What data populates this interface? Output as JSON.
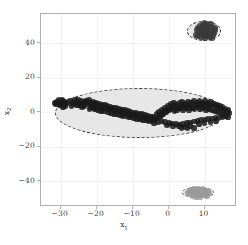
{
  "figure": {
    "background_color": "#ffffff",
    "frame_color": "#b0b0b0",
    "grid_color": "#f2f2f2"
  },
  "axis": {
    "xlabel_main": "x",
    "xlabel_sub": "1",
    "ylabel_main": "x",
    "ylabel_sub": "2",
    "x_ticklabels": [
      "−30",
      "−20",
      "−10",
      "0",
      "10"
    ],
    "y_ticklabels": [
      "40",
      "20",
      "0",
      "−20",
      "−40"
    ]
  },
  "chart_data": {
    "type": "scatter",
    "title": "",
    "xlabel": "x1",
    "ylabel": "x2",
    "xlim": [
      -35.5,
      19.0
    ],
    "ylim": [
      -55.0,
      57.0
    ],
    "xticks": [
      -30,
      -20,
      -10,
      0,
      10
    ],
    "yticks": [
      -40,
      -20,
      0,
      20,
      40
    ],
    "grid": true,
    "legend": "none",
    "annotations": [
      {
        "type": "ellipse",
        "name": "cluster-1-ellipse",
        "center": [
          -8.0,
          -0.5
        ],
        "width": 47.0,
        "height": 29.0,
        "angle": 0,
        "linestyle": "dashed",
        "edgecolor": "#2b2b2b",
        "facecolor": "#e6e6e6",
        "alpha": 0.55
      },
      {
        "type": "ellipse",
        "name": "cluster-2-ellipse",
        "center": [
          9.8,
          47.0
        ],
        "width": 9.5,
        "height": 11.5,
        "angle": 0,
        "linestyle": "dashed",
        "edgecolor": "#2b2b2b",
        "facecolor": "#e6e6e6",
        "alpha": 0.55
      },
      {
        "type": "ellipse",
        "name": "cluster-3-ellipse",
        "center": [
          8.2,
          -46.5
        ],
        "width": 9.0,
        "height": 6.0,
        "angle": 0,
        "linestyle": "dashed",
        "edgecolor": "#6e6e6e",
        "facecolor": "#e6e6e6",
        "alpha": 0.55
      }
    ],
    "series": [
      {
        "name": "cluster-1",
        "marker": "o",
        "color": "#1a1a1a",
        "size": 18,
        "alpha": 0.85,
        "points": [
          [
            -31.6,
            5.4
          ],
          [
            -31.0,
            6.2
          ],
          [
            -30.4,
            5.0
          ],
          [
            -30.6,
            6.9
          ],
          [
            -30.0,
            5.7
          ],
          [
            -29.5,
            6.4
          ],
          [
            -29.9,
            4.4
          ],
          [
            -29.2,
            5.2
          ],
          [
            -28.8,
            6.0
          ],
          [
            -29.6,
            7.1
          ],
          [
            -28.4,
            4.8
          ],
          [
            -30.2,
            3.9
          ],
          [
            -31.3,
            4.6
          ],
          [
            -28.9,
            3.6
          ],
          [
            -29.4,
            2.9
          ],
          [
            -25.8,
            6.1
          ],
          [
            -25.2,
            7.0
          ],
          [
            -24.7,
            5.6
          ],
          [
            -24.2,
            6.8
          ],
          [
            -23.8,
            5.1
          ],
          [
            -24.9,
            4.3
          ],
          [
            -23.4,
            6.3
          ],
          [
            -23.0,
            4.9
          ],
          [
            -25.5,
            4.0
          ],
          [
            -22.6,
            5.8
          ],
          [
            -22.2,
            7.2
          ],
          [
            -21.8,
            5.2
          ],
          [
            -22.9,
            6.6
          ],
          [
            -21.4,
            4.4
          ],
          [
            -23.6,
            3.4
          ],
          [
            -21.0,
            6.0
          ],
          [
            -20.6,
            4.7
          ],
          [
            -21.6,
            3.1
          ],
          [
            -20.2,
            5.5
          ],
          [
            -19.8,
            3.8
          ],
          [
            -20.9,
            2.4
          ],
          [
            -19.4,
            5.0
          ],
          [
            -19.0,
            3.2
          ],
          [
            -20.4,
            1.8
          ],
          [
            -18.6,
            4.4
          ],
          [
            -18.2,
            2.6
          ],
          [
            -19.6,
            1.4
          ],
          [
            -17.8,
            4.0
          ],
          [
            -17.4,
            2.2
          ],
          [
            -18.9,
            0.9
          ],
          [
            -17.0,
            3.6
          ],
          [
            -16.6,
            1.8
          ],
          [
            -18.0,
            0.4
          ],
          [
            -16.2,
            3.1
          ],
          [
            -15.8,
            1.3
          ],
          [
            -16.9,
            0.0
          ],
          [
            -15.4,
            2.7
          ],
          [
            -15.0,
            0.9
          ],
          [
            -16.0,
            -0.5
          ],
          [
            -14.6,
            2.3
          ],
          [
            -14.2,
            0.5
          ],
          [
            -15.2,
            -0.9
          ],
          [
            -13.8,
            1.9
          ],
          [
            -13.4,
            0.1
          ],
          [
            -14.4,
            -1.3
          ],
          [
            -13.0,
            1.5
          ],
          [
            -12.6,
            -0.3
          ],
          [
            -13.6,
            -1.7
          ],
          [
            -12.2,
            1.1
          ],
          [
            -11.8,
            -0.7
          ],
          [
            -12.8,
            -2.1
          ],
          [
            -11.4,
            0.7
          ],
          [
            -11.0,
            -1.1
          ],
          [
            -12.0,
            -2.4
          ],
          [
            -10.6,
            0.3
          ],
          [
            -10.2,
            -1.5
          ],
          [
            -11.2,
            -2.8
          ],
          [
            -9.8,
            -0.1
          ],
          [
            -9.4,
            -1.9
          ],
          [
            -10.4,
            -3.1
          ],
          [
            -9.0,
            -0.5
          ],
          [
            -8.6,
            -2.3
          ],
          [
            -9.6,
            -3.5
          ],
          [
            -8.2,
            -0.9
          ],
          [
            -7.8,
            -2.6
          ],
          [
            -8.8,
            -3.8
          ],
          [
            -7.4,
            -1.2
          ],
          [
            -7.0,
            -3.0
          ],
          [
            -8.0,
            -4.1
          ],
          [
            -6.6,
            -1.6
          ],
          [
            -6.2,
            -3.3
          ],
          [
            -7.2,
            -4.4
          ],
          [
            -5.8,
            -2.0
          ],
          [
            -5.4,
            -3.7
          ],
          [
            -6.4,
            -4.8
          ],
          [
            -5.0,
            -2.4
          ],
          [
            -4.6,
            -4.0
          ],
          [
            -5.6,
            -5.1
          ],
          [
            -4.2,
            -2.7
          ],
          [
            -3.8,
            -4.3
          ],
          [
            -4.8,
            -5.4
          ],
          [
            -3.4,
            -1.2
          ],
          [
            -3.0,
            -3.0
          ],
          [
            -4.0,
            -4.6
          ],
          [
            -2.6,
            0.2
          ],
          [
            -2.2,
            -1.6
          ],
          [
            -3.2,
            -3.4
          ],
          [
            -1.8,
            1.4
          ],
          [
            -1.4,
            -0.4
          ],
          [
            -2.4,
            -2.2
          ],
          [
            -1.0,
            2.6
          ],
          [
            -0.6,
            0.8
          ],
          [
            -1.6,
            -1.0
          ],
          [
            -0.2,
            3.8
          ],
          [
            0.2,
            1.9
          ],
          [
            -0.8,
            0.1
          ],
          [
            0.6,
            4.8
          ],
          [
            1.0,
            2.9
          ],
          [
            0.0,
            1.1
          ],
          [
            1.4,
            5.6
          ],
          [
            1.8,
            3.6
          ],
          [
            0.8,
            1.8
          ],
          [
            2.2,
            4.4
          ],
          [
            2.6,
            2.5
          ],
          [
            1.6,
            0.7
          ],
          [
            3.0,
            5.2
          ],
          [
            3.4,
            3.3
          ],
          [
            2.4,
            1.4
          ],
          [
            3.8,
            6.0
          ],
          [
            4.2,
            4.0
          ],
          [
            3.2,
            2.1
          ],
          [
            4.6,
            5.0
          ],
          [
            5.0,
            3.0
          ],
          [
            4.0,
            1.1
          ],
          [
            5.4,
            6.3
          ],
          [
            5.8,
            4.2
          ],
          [
            4.8,
            2.3
          ],
          [
            6.2,
            5.3
          ],
          [
            6.6,
            3.2
          ],
          [
            5.6,
            1.3
          ],
          [
            7.0,
            6.5
          ],
          [
            7.4,
            4.5
          ],
          [
            6.4,
            2.5
          ],
          [
            7.8,
            5.5
          ],
          [
            8.2,
            3.5
          ],
          [
            7.2,
            1.5
          ],
          [
            8.6,
            6.7
          ],
          [
            9.0,
            4.7
          ],
          [
            8.0,
            2.7
          ],
          [
            9.4,
            5.7
          ],
          [
            9.8,
            3.7
          ],
          [
            8.8,
            1.7
          ],
          [
            10.2,
            6.4
          ],
          [
            10.6,
            4.4
          ],
          [
            9.6,
            2.4
          ],
          [
            11.0,
            5.4
          ],
          [
            11.4,
            3.4
          ],
          [
            10.4,
            1.4
          ],
          [
            11.8,
            5.9
          ],
          [
            12.2,
            3.9
          ],
          [
            11.2,
            1.9
          ],
          [
            12.6,
            5.0
          ],
          [
            13.0,
            3.0
          ],
          [
            12.0,
            1.0
          ],
          [
            13.4,
            4.5
          ],
          [
            13.8,
            2.5
          ],
          [
            12.8,
            0.5
          ],
          [
            14.2,
            3.8
          ],
          [
            14.6,
            1.8
          ],
          [
            13.6,
            -0.2
          ],
          [
            15.0,
            3.0
          ],
          [
            15.4,
            1.0
          ],
          [
            14.4,
            -0.8
          ],
          [
            15.8,
            2.2
          ],
          [
            16.2,
            0.3
          ],
          [
            15.2,
            -1.4
          ],
          [
            16.6,
            1.4
          ],
          [
            16.0,
            -2.0
          ],
          [
            16.9,
            -0.5
          ],
          [
            16.4,
            -2.6
          ],
          [
            -2.0,
            -5.0
          ],
          [
            -1.0,
            -5.6
          ],
          [
            0.0,
            -6.2
          ],
          [
            1.0,
            -6.6
          ],
          [
            2.0,
            -6.9
          ],
          [
            3.0,
            -7.1
          ],
          [
            4.0,
            -6.8
          ],
          [
            5.0,
            -6.4
          ],
          [
            6.0,
            -5.9
          ],
          [
            7.0,
            -5.4
          ],
          [
            8.0,
            -5.0
          ],
          [
            9.0,
            -4.6
          ],
          [
            10.0,
            -4.2
          ],
          [
            11.0,
            -3.9
          ],
          [
            12.0,
            -3.6
          ],
          [
            13.0,
            -3.3
          ],
          [
            14.0,
            -3.0
          ],
          [
            15.0,
            -2.6
          ],
          [
            -3.0,
            -6.0
          ],
          [
            -4.0,
            -6.3
          ],
          [
            2.8,
            -8.0
          ],
          [
            4.4,
            -8.4
          ],
          [
            6.0,
            -8.0
          ],
          [
            1.2,
            -8.2
          ],
          [
            -0.4,
            -7.7
          ],
          [
            8.4,
            -7.0
          ],
          [
            10.0,
            -6.4
          ],
          [
            11.6,
            -5.8
          ],
          [
            13.2,
            -5.2
          ],
          [
            5.2,
            -9.0
          ],
          [
            3.6,
            -9.2
          ],
          [
            7.0,
            -9.0
          ],
          [
            -26.8,
            5.5
          ],
          [
            -27.4,
            6.4
          ],
          [
            -26.2,
            4.6
          ],
          [
            -27.0,
            3.8
          ],
          [
            -24.0,
            2.8
          ],
          [
            -22.0,
            2.0
          ],
          [
            -26.0,
            7.2
          ]
        ]
      },
      {
        "name": "cluster-2",
        "marker": "o",
        "color": "#3a3a3a",
        "size": 18,
        "alpha": 0.85,
        "points": [
          [
            8.0,
            49.0
          ],
          [
            8.6,
            50.4
          ],
          [
            9.2,
            48.2
          ],
          [
            9.8,
            50.0
          ],
          [
            10.4,
            48.8
          ],
          [
            11.0,
            50.2
          ],
          [
            11.6,
            48.4
          ],
          [
            12.2,
            49.6
          ],
          [
            8.3,
            46.6
          ],
          [
            8.9,
            45.4
          ],
          [
            9.5,
            46.2
          ],
          [
            10.1,
            45.0
          ],
          [
            10.7,
            46.4
          ],
          [
            11.3,
            45.2
          ],
          [
            11.9,
            46.8
          ],
          [
            12.4,
            44.8
          ],
          [
            7.8,
            47.8
          ],
          [
            12.8,
            47.6
          ],
          [
            9.0,
            43.6
          ],
          [
            10.2,
            43.0
          ],
          [
            11.4,
            43.4
          ],
          [
            9.6,
            51.2
          ],
          [
            10.8,
            51.0
          ],
          [
            8.2,
            44.4
          ],
          [
            12.0,
            42.8
          ],
          [
            9.4,
            47.2
          ],
          [
            10.6,
            47.0
          ],
          [
            11.0,
            44.0
          ],
          [
            8.8,
            48.6
          ],
          [
            12.6,
            45.8
          ],
          [
            7.6,
            45.0
          ],
          [
            13.0,
            49.0
          ],
          [
            10.0,
            52.0
          ],
          [
            9.9,
            44.2
          ],
          [
            11.7,
            51.4
          ]
        ]
      },
      {
        "name": "cluster-3",
        "marker": "o",
        "color": "#9a9a9a",
        "size": 18,
        "alpha": 0.8,
        "points": [
          [
            5.6,
            -46.0
          ],
          [
            6.2,
            -45.0
          ],
          [
            6.8,
            -46.8
          ],
          [
            7.4,
            -45.4
          ],
          [
            8.0,
            -46.4
          ],
          [
            8.6,
            -45.2
          ],
          [
            9.2,
            -46.6
          ],
          [
            9.8,
            -45.6
          ],
          [
            10.4,
            -46.2
          ],
          [
            6.0,
            -47.8
          ],
          [
            6.6,
            -48.6
          ],
          [
            7.2,
            -47.4
          ],
          [
            7.8,
            -48.2
          ],
          [
            8.4,
            -47.6
          ],
          [
            9.0,
            -48.4
          ],
          [
            9.6,
            -47.2
          ],
          [
            10.2,
            -48.0
          ],
          [
            10.8,
            -47.0
          ],
          [
            5.4,
            -47.0
          ],
          [
            11.0,
            -45.8
          ],
          [
            7.0,
            -44.4
          ],
          [
            8.2,
            -44.2
          ],
          [
            9.4,
            -44.6
          ],
          [
            7.6,
            -49.2
          ],
          [
            8.8,
            -49.0
          ],
          [
            6.4,
            -44.8
          ],
          [
            10.0,
            -44.8
          ],
          [
            10.6,
            -48.8
          ],
          [
            5.8,
            -45.4
          ],
          [
            11.2,
            -46.8
          ]
        ]
      }
    ]
  }
}
